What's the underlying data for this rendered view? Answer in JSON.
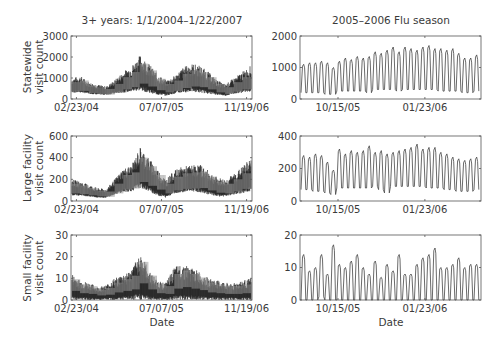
{
  "figure": {
    "left_title": "3+ years: 1/1/2004–1/22/2007",
    "right_title": "2005–2006 Flu season",
    "xlabel": "Date",
    "rows": [
      {
        "ylabel_line1": "Statewide",
        "ylabel_line2": "visit count"
      },
      {
        "ylabel_line1": "Large facility",
        "ylabel_line2": "visit count"
      },
      {
        "ylabel_line1": "Small facility",
        "ylabel_line2": "visit count"
      }
    ]
  },
  "chart_data": [
    {
      "type": "line",
      "title": "3+ years: 1/1/2004–1/22/2007",
      "xlabel": "",
      "ylabel": "Statewide visit count",
      "x_ticks": [
        "02/23/04",
        "07/07/05",
        "11/19/06"
      ],
      "y_ticks": [
        0,
        1000,
        2000,
        3000
      ],
      "ylim": [
        0,
        3000
      ],
      "description": "Daily counts, strong weekly oscillation; seasonal peaks ~2100 (winter 2004-05), ~1700 (winter 2005-06), ~1600 (late 2006); troughs ~200-500",
      "envelope_upper": [
        1000,
        1100,
        800,
        700,
        600,
        900,
        1300,
        1600,
        2100,
        1700,
        1200,
        900,
        1100,
        1500,
        1700,
        1600,
        1300,
        900,
        700,
        1000,
        1300,
        1600
      ],
      "envelope_lower": [
        300,
        300,
        250,
        200,
        200,
        250,
        300,
        350,
        400,
        300,
        200,
        150,
        250,
        300,
        350,
        300,
        250,
        200,
        150,
        250,
        300,
        350
      ]
    },
    {
      "type": "line",
      "title": "2005–2006 Flu season",
      "xlabel": "",
      "ylabel": "Statewide visit count",
      "x_ticks": [
        "10/15/05",
        "01/23/06"
      ],
      "y_ticks": [
        0,
        1000,
        2000
      ],
      "ylim": [
        0,
        2000
      ],
      "weekly_peaks": [
        1100,
        1150,
        1150,
        1200,
        1150,
        1000,
        1200,
        1300,
        1250,
        1350,
        1300,
        1350,
        1500,
        1450,
        1550,
        1650,
        1500,
        1650,
        1600,
        1550,
        1650,
        1700,
        1600,
        1600,
        1550,
        1600,
        1450,
        1300,
        1300,
        1400
      ],
      "weekly_troughs": [
        200,
        200,
        200,
        200,
        150,
        150,
        250,
        250,
        250,
        250,
        250,
        200,
        300,
        300,
        300,
        300,
        250,
        300,
        300,
        300,
        300,
        300,
        300,
        250,
        250,
        250,
        250,
        200,
        200,
        250
      ]
    },
    {
      "type": "line",
      "title": "",
      "xlabel": "",
      "ylabel": "Large facility visit count",
      "x_ticks": [
        "02/23/04",
        "07/07/05",
        "11/19/06"
      ],
      "y_ticks": [
        0,
        200,
        400,
        600
      ],
      "ylim": [
        0,
        600
      ],
      "envelope_upper": [
        200,
        180,
        150,
        120,
        110,
        200,
        300,
        330,
        500,
        400,
        300,
        200,
        280,
        320,
        330,
        340,
        280,
        220,
        200,
        250,
        320,
        400
      ],
      "envelope_lower": [
        50,
        50,
        40,
        30,
        30,
        60,
        80,
        90,
        120,
        90,
        50,
        30,
        70,
        80,
        90,
        80,
        60,
        40,
        40,
        60,
        70,
        90
      ]
    },
    {
      "type": "line",
      "title": "",
      "xlabel": "",
      "ylabel": "Large facility visit count",
      "x_ticks": [
        "10/15/05",
        "01/23/06"
      ],
      "y_ticks": [
        0,
        200,
        400
      ],
      "ylim": [
        0,
        400
      ],
      "weekly_peaks": [
        280,
        270,
        290,
        280,
        240,
        190,
        320,
        290,
        310,
        300,
        310,
        340,
        300,
        310,
        290,
        300,
        310,
        320,
        330,
        350,
        320,
        330,
        330,
        300,
        290,
        270,
        260,
        250,
        260,
        270
      ],
      "weekly_troughs": [
        70,
        70,
        60,
        60,
        50,
        40,
        80,
        80,
        80,
        80,
        80,
        80,
        90,
        70,
        50,
        90,
        90,
        90,
        90,
        90,
        90,
        80,
        80,
        80,
        70,
        70,
        60,
        60,
        60,
        70
      ]
    },
    {
      "type": "line",
      "title": "",
      "xlabel": "Date",
      "ylabel": "Small facility visit count",
      "x_ticks": [
        "02/23/04",
        "07/07/05",
        "11/19/06"
      ],
      "y_ticks": [
        0,
        10,
        20,
        30
      ],
      "ylim": [
        0,
        30
      ],
      "envelope_upper": [
        12,
        9,
        8,
        6,
        7,
        10,
        12,
        14,
        22,
        14,
        9,
        8,
        15,
        17,
        15,
        13,
        10,
        9,
        8,
        8,
        9,
        10
      ],
      "envelope_lower": [
        0,
        0,
        0,
        0,
        0,
        0,
        0,
        0,
        0,
        0,
        0,
        0,
        0,
        0,
        0,
        0,
        0,
        0,
        0,
        0,
        0,
        0
      ]
    },
    {
      "type": "line",
      "title": "",
      "xlabel": "Date",
      "ylabel": "Small facility visit count",
      "x_ticks": [
        "10/15/05",
        "01/23/06"
      ],
      "y_ticks": [
        0,
        10,
        20
      ],
      "ylim": [
        0,
        20
      ],
      "weekly_peaks": [
        14,
        9,
        10,
        14,
        8,
        17,
        11,
        10,
        12,
        14,
        10,
        8,
        12,
        7,
        11,
        9,
        14,
        8,
        8,
        11,
        13,
        14,
        16,
        10,
        10,
        11,
        13,
        10,
        11,
        11
      ],
      "weekly_troughs": [
        0,
        0,
        0,
        1,
        0,
        0,
        0,
        0,
        0,
        0,
        0,
        0,
        0,
        0,
        0,
        0,
        0,
        0,
        0,
        0,
        0,
        0,
        0,
        0,
        0,
        0,
        0,
        0,
        0,
        0
      ]
    }
  ]
}
